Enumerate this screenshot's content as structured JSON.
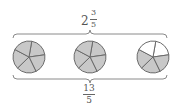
{
  "diagram": {
    "top_label": {
      "whole": "2",
      "numerator": "3",
      "denominator": "5"
    },
    "bottom_label": {
      "numerator": "13",
      "denominator": "5"
    },
    "circles": [
      {
        "sectors": 5,
        "shaded": 5
      },
      {
        "sectors": 5,
        "shaded": 5
      },
      {
        "sectors": 5,
        "shaded": 3
      }
    ],
    "colors": {
      "shade": "#c8c8c8",
      "stroke": "#6b6b6b",
      "unshaded": "#ffffff",
      "brace": "#8a8a8a"
    }
  }
}
